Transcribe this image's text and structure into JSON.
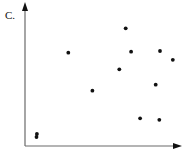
{
  "panel_label": "C.",
  "colors": {
    "axis": "#6a6a6a",
    "point": "#111111",
    "arrow": "#111111"
  },
  "chart_data": {
    "type": "scatter",
    "title": "",
    "panel": "C.",
    "xlabel": "",
    "ylabel": "",
    "xlim": [
      0,
      10.5
    ],
    "ylim": [
      0,
      9.5
    ],
    "grid": false,
    "legend": null,
    "ticks": {
      "x": [],
      "y": []
    },
    "series": [
      {
        "name": "points",
        "x": [
          0.79,
          0.77,
          2.89,
          4.49,
          6.29,
          6.71,
          7.07,
          7.67,
          8.71,
          8.95,
          9.0,
          9.85
        ],
        "y": [
          0.8,
          0.6,
          6.22,
          3.69,
          5.11,
          7.85,
          6.29,
          1.85,
          4.09,
          1.75,
          6.33,
          5.75
        ]
      }
    ]
  }
}
